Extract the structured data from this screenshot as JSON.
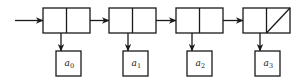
{
  "diagram": {
    "type": "linked-list",
    "colors": {
      "stroke": "#1a1a1a",
      "background": "#ffffff"
    },
    "head_arrow": true,
    "nodes": [
      {
        "id": "node-0",
        "element": {
          "base": "a",
          "subscript": "0"
        },
        "next_null": false
      },
      {
        "id": "node-1",
        "element": {
          "base": "a",
          "subscript": "1"
        },
        "next_null": false
      },
      {
        "id": "node-2",
        "element": {
          "base": "a",
          "subscript": "2"
        },
        "next_null": false
      },
      {
        "id": "node-3",
        "element": {
          "base": "a",
          "subscript": "3"
        },
        "next_null": true
      }
    ]
  }
}
